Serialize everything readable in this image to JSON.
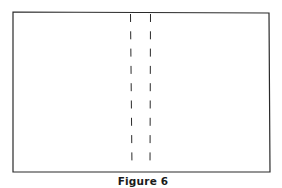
{
  "figure": {
    "caption": "Figure 6",
    "rectangle": {
      "x1": 13,
      "y1": 12,
      "x2": 270,
      "y2": 172,
      "stroke": "#2a2a2a"
    },
    "fold_lines": [
      {
        "name": "left-fold-line",
        "x_top": 130.5,
        "x_bottom": 132,
        "y_top": 14,
        "y_bottom": 169,
        "dash": 8,
        "gap": 9.3
      },
      {
        "name": "right-fold-line",
        "x_top": 150.5,
        "x_bottom": 150,
        "y_top": 14,
        "y_bottom": 169,
        "dash": 8,
        "gap": 9.3
      }
    ],
    "line_color": "#2a2a2a"
  }
}
